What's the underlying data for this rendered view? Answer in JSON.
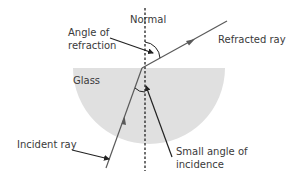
{
  "diagram": {
    "labels": {
      "normal": "Normal",
      "angle_of_refraction_line1": "Angle of",
      "angle_of_refraction_line2": "refraction",
      "refracted_ray": "Refracted ray",
      "glass": "Glass",
      "incident_ray": "Incident ray",
      "small_angle_line1": "Small angle of",
      "small_angle_line2": "incidence"
    },
    "colors": {
      "glass_fill": "#e0e0e0",
      "ray": "#5a5a5a",
      "pointer": "#222222",
      "normal_line": "#222222",
      "text": "#3a3a3a"
    }
  }
}
